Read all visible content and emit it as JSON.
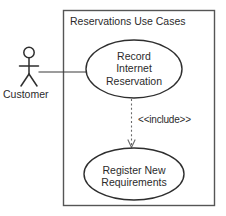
{
  "diagram": {
    "type": "uml-use-case-diagram",
    "boundary": {
      "title": "Reservations Use Cases"
    },
    "actor": {
      "name": "Customer",
      "icon": "stick-figure-actor-icon"
    },
    "use_cases": [
      {
        "id": "record-internet-reservation",
        "lines": [
          "Record",
          "Internet",
          "Reservation"
        ],
        "text": "Record Internet Reservation"
      },
      {
        "id": "register-new-requirements",
        "lines": [
          "Register New",
          "Requirements"
        ],
        "text": "Register New Requirements"
      }
    ],
    "relationships": [
      {
        "kind": "association",
        "from": "Customer",
        "to": "Record Internet Reservation",
        "label": ""
      },
      {
        "kind": "include-dependency",
        "from": "Record Internet Reservation",
        "to": "Register New Requirements",
        "label": "<<include>>"
      }
    ],
    "colors": {
      "background": "#ffffff",
      "boundary_stroke": "#555555",
      "ellipse_stroke": "#2e2e2e",
      "dashed_stroke": "#6a6a6a",
      "text": "#2b2b2b"
    }
  }
}
